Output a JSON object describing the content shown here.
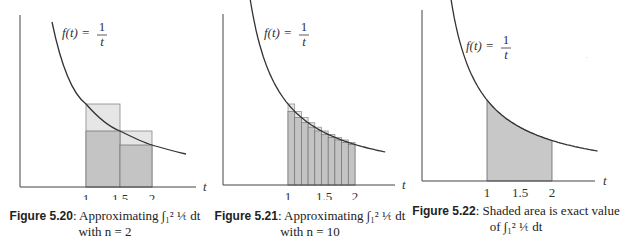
{
  "figures": [
    {
      "id": "5.20",
      "caption_label": "Figure 5.20",
      "caption_text": ": Approximating ∫₁² ¹⁄ₜ dt",
      "caption_line2": "with n = 2",
      "function_label": "f(t) = 1/t",
      "axis_label": "t",
      "ticks": [
        "1",
        "1.5",
        "2"
      ]
    },
    {
      "id": "5.21",
      "caption_label": "Figure 5.21",
      "caption_text": ": Approximating ∫₁² ¹⁄ₜ dt",
      "caption_line2": "with n = 10",
      "function_label": "f(t) = 1/t",
      "axis_label": "t",
      "ticks": [
        "1",
        "1.5",
        "2"
      ]
    },
    {
      "id": "5.22",
      "caption_label": "Figure 5.22",
      "caption_text": ": Shaded area is exact value",
      "caption_line2": "of ∫₁² ¹⁄ₜ dt",
      "function_label": "f(t) = 1/t",
      "axis_label": "t",
      "ticks": [
        "1",
        "1.5",
        "2"
      ]
    }
  ],
  "colors": {
    "upper_rect": "#e6e6e6",
    "lower_rect": "#c4c4c4",
    "area": "#c8c8c8",
    "curve": "#333333"
  },
  "chart_data": [
    {
      "type": "area",
      "title": "Figure 5.20: Approximating integral from 1 to 2 of 1/t dt with n = 2",
      "xlabel": "t",
      "ylabel": "",
      "function": "f(t) = 1/t",
      "x_ticks": [
        1,
        1.5,
        2
      ],
      "n": 2,
      "left_sum_rectangles": [
        {
          "x0": 1,
          "x1": 1.5,
          "height": 1.0
        },
        {
          "x0": 1.5,
          "x1": 2,
          "height": 0.667
        }
      ],
      "right_sum_rectangles": [
        {
          "x0": 1,
          "x1": 1.5,
          "height": 0.667
        },
        {
          "x0": 1.5,
          "x1": 2,
          "height": 0.5
        }
      ]
    },
    {
      "type": "area",
      "title": "Figure 5.21: Approximating integral from 1 to 2 of 1/t dt with n = 10",
      "xlabel": "t",
      "ylabel": "",
      "function": "f(t) = 1/t",
      "x_ticks": [
        1,
        1.5,
        2
      ],
      "n": 10,
      "left_sum_heights": [
        1.0,
        0.909,
        0.833,
        0.769,
        0.714,
        0.667,
        0.625,
        0.588,
        0.556,
        0.526
      ],
      "right_sum_heights": [
        0.909,
        0.833,
        0.769,
        0.714,
        0.667,
        0.625,
        0.588,
        0.556,
        0.526,
        0.5
      ]
    },
    {
      "type": "area",
      "title": "Figure 5.22: Shaded area is exact value of integral from 1 to 2 of 1/t dt",
      "xlabel": "t",
      "ylabel": "",
      "function": "f(t) = 1/t",
      "x_ticks": [
        1,
        1.5,
        2
      ],
      "shaded_interval": [
        1,
        2
      ]
    }
  ]
}
